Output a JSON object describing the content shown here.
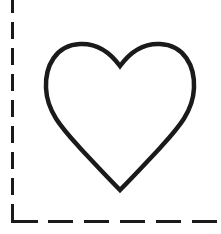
{
  "figure": {
    "background": "#ffffff",
    "stroke_color": "#1a1a1a",
    "shape": "heart-outline",
    "border": {
      "style": "dashed",
      "sides": [
        "left",
        "bottom"
      ]
    }
  }
}
